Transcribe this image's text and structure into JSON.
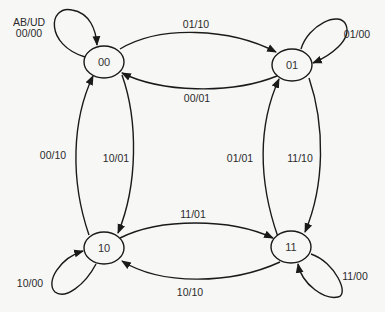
{
  "diagram": {
    "type": "state-diagram",
    "legend": {
      "header": "AB/UD"
    },
    "states": [
      {
        "id": "00",
        "label": "00"
      },
      {
        "id": "01",
        "label": "01"
      },
      {
        "id": "10",
        "label": "10"
      },
      {
        "id": "11",
        "label": "11"
      }
    ],
    "transitions": [
      {
        "from": "00",
        "to": "00",
        "label": "00/00"
      },
      {
        "from": "00",
        "to": "01",
        "label": "01/10"
      },
      {
        "from": "01",
        "to": "00",
        "label": "00/01"
      },
      {
        "from": "01",
        "to": "01",
        "label": "01/00"
      },
      {
        "from": "10",
        "to": "00",
        "label": "00/10"
      },
      {
        "from": "00",
        "to": "10",
        "label": "10/01"
      },
      {
        "from": "11",
        "to": "01",
        "label": "01/01"
      },
      {
        "from": "01",
        "to": "11",
        "label": "11/10"
      },
      {
        "from": "10",
        "to": "11",
        "label": "11/01"
      },
      {
        "from": "11",
        "to": "10",
        "label": "10/10"
      },
      {
        "from": "10",
        "to": "10",
        "label": "10/00"
      },
      {
        "from": "11",
        "to": "11",
        "label": "11/00"
      }
    ]
  },
  "colors": {
    "stroke": "#1a1a1a",
    "background": "#f7f7f6",
    "text": "#2a2a2a"
  }
}
